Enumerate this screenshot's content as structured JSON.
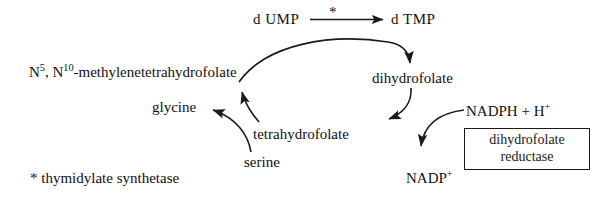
{
  "diagram": {
    "type": "biochemical-pathway",
    "nodes": {
      "dump": "d UMP",
      "dtmp": "d TMP",
      "star_marker": "*",
      "methylenetetrahydrofolate": "N5, N10-methylenetetrahydrofolate",
      "dihydrofolate": "dihydrofolate",
      "tetrahydrofolate": "tetrahydrofolate",
      "glycine": "glycine",
      "serine": "serine",
      "nadph": "NADPH + H+",
      "nadp": "NADP+"
    },
    "enzyme_box": {
      "line1": "dihydrofolate",
      "line2": "reductase"
    },
    "footnote": "* thymidylate synthetase",
    "colors": {
      "ink": "#1a1a1a",
      "background": "#ffffff"
    }
  }
}
